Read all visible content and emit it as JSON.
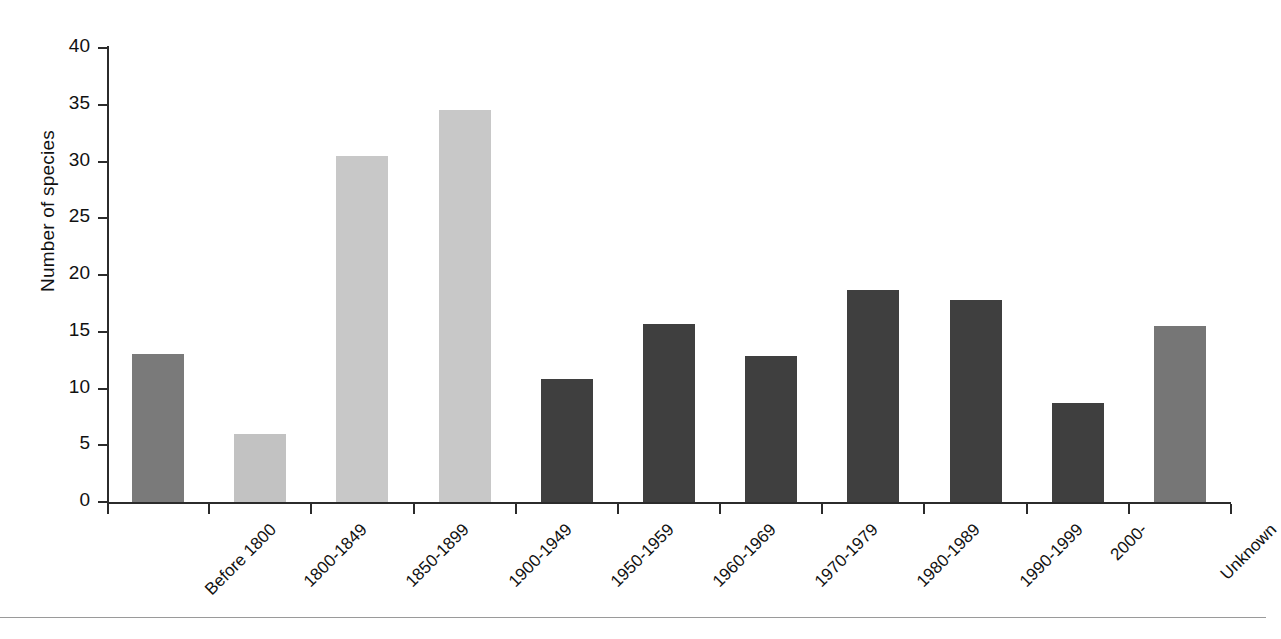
{
  "chart_data": {
    "type": "bar",
    "title": "",
    "xlabel": "",
    "ylabel": "Number of species",
    "ylim": [
      0,
      40
    ],
    "yticks": [
      0,
      5,
      10,
      15,
      20,
      25,
      30,
      35,
      40
    ],
    "ytick_labels": [
      "0",
      "5",
      "10",
      "15",
      "20",
      "25",
      "30",
      "35",
      "40"
    ],
    "grid": false,
    "legend": "none",
    "categories": [
      "Before 1800",
      "1800-1849",
      "1850-1899",
      "1900-1949",
      "1950-1959",
      "1960-1969",
      "1970-1979",
      "1980-1989",
      "1990-1999",
      "2000-",
      "Unknown"
    ],
    "values": [
      13.0,
      6.0,
      30.5,
      34.5,
      10.8,
      15.7,
      12.9,
      18.7,
      17.8,
      8.7,
      15.5
    ],
    "bar_colors": [
      "#7a7a7a",
      "#c2c2c2",
      "#c8c8c8",
      "#c8c8c8",
      "#3f3f3f",
      "#3f3f3f",
      "#3f3f3f",
      "#3f3f3f",
      "#3f3f3f",
      "#3f3f3f",
      "#767676"
    ]
  },
  "axes": {
    "y_title": "Number of species"
  },
  "colors": {
    "axis": "#2b2b2b",
    "text": "#111111",
    "rule": "#9a9a9a",
    "background": "#ffffff"
  }
}
